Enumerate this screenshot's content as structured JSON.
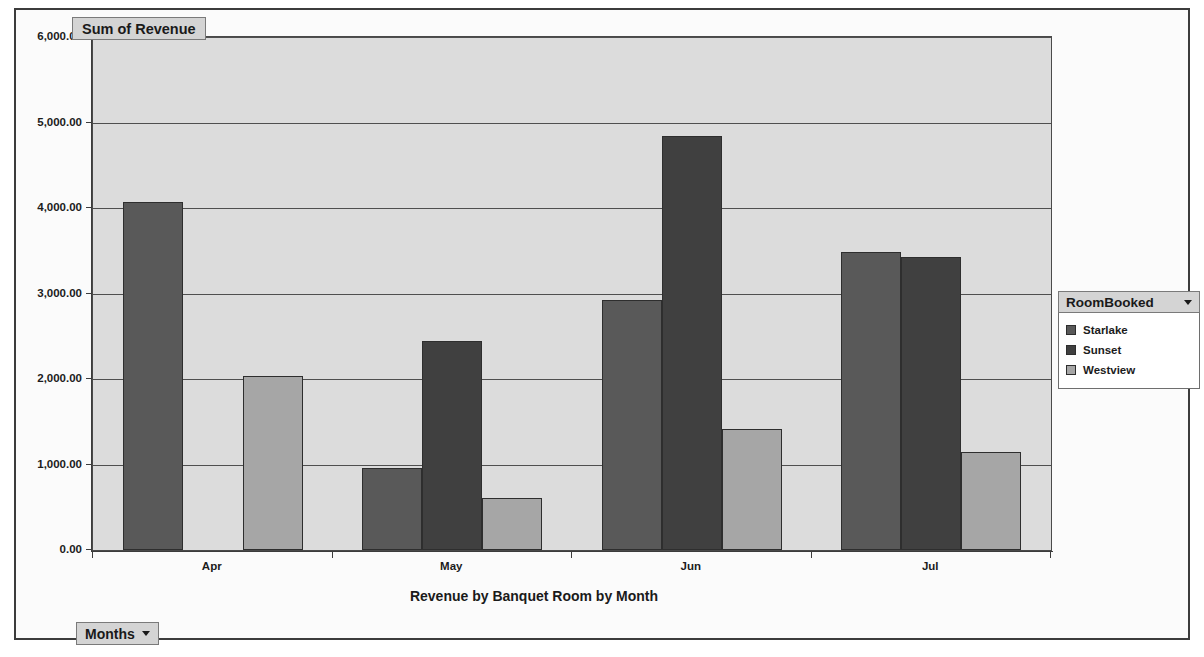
{
  "value_field": {
    "label": "Sum of Revenue"
  },
  "category_field": {
    "label": "Months",
    "dropdown_icon": "chevron-down-icon"
  },
  "legend": {
    "title": "RoomBooked",
    "dropdown_icon": "chevron-down-icon",
    "items": [
      {
        "label": "Starlake",
        "color": "#595959"
      },
      {
        "label": "Sunset",
        "color": "#404040"
      },
      {
        "label": "Westview",
        "color": "#a6a6a6"
      }
    ]
  },
  "chart_data": {
    "type": "bar",
    "title": "",
    "xlabel": "Revenue by Banquet Room by Month",
    "ylabel": "Sum of Revenue",
    "categories": [
      "Apr",
      "May",
      "Jun",
      "Jul"
    ],
    "ylim": [
      0,
      6000
    ],
    "ytick_labels": [
      "0.00",
      "1,000.00",
      "2,000.00",
      "3,000.00",
      "4,000.00",
      "5,000.00",
      "6,000.00"
    ],
    "ytick_values": [
      0,
      1000,
      2000,
      3000,
      4000,
      5000,
      6000
    ],
    "grid": true,
    "legend_position": "right",
    "series": [
      {
        "name": "Starlake",
        "color": "#595959",
        "values": [
          4070,
          960,
          2930,
          3490
        ]
      },
      {
        "name": "Sunset",
        "color": "#404040",
        "values": [
          null,
          2450,
          4840,
          3430
        ]
      },
      {
        "name": "Westview",
        "color": "#a6a6a6",
        "values": [
          2040,
          610,
          1420,
          1150
        ]
      }
    ]
  },
  "colors": {
    "plot_background": "#dcdcdc",
    "frame_background": "#fbfbfb",
    "axis": "#3c3c3c",
    "button_face": "#d4d4d4"
  }
}
